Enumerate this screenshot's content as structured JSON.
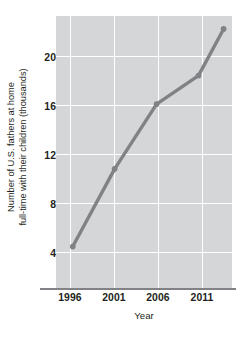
{
  "chart_data": {
    "type": "line",
    "title": "",
    "xlabel": "Year",
    "ylabel": "Number of U.S. fathers at home\nfull-time with their children (thousands)",
    "x": [
      1996,
      2001,
      2006,
      2011,
      2014
    ],
    "values": [
      40,
      100,
      150,
      172,
      208
    ],
    "series": [
      {
        "name": "U.S. stay-at-home fathers",
        "values": [
          40,
          100,
          150,
          172,
          208
        ]
      }
    ],
    "xtick_labels": [
      "1996",
      "2001",
      "2006",
      "2011"
    ],
    "xticks": [
      1996,
      2001,
      2006,
      2011
    ],
    "ytick_labels": [
      "200",
      "160",
      "120",
      "80",
      "40"
    ],
    "yticks": [
      200,
      160,
      120,
      80,
      40
    ],
    "xlim": [
      1994,
      2015
    ],
    "ylim": [
      8,
      218
    ],
    "grid": true,
    "legend": "none",
    "marker": "circle",
    "line_color": "#808285",
    "panel_color": "#d5d6d8",
    "grid_color": "#ffffff",
    "text_color": "#231f20"
  },
  "axes": {
    "y_title_line1": "Number of U.S. fathers at home",
    "y_title_line2": "full-time with their children (thousands)",
    "x_title": "Year"
  },
  "caption": {
    "text": ""
  }
}
